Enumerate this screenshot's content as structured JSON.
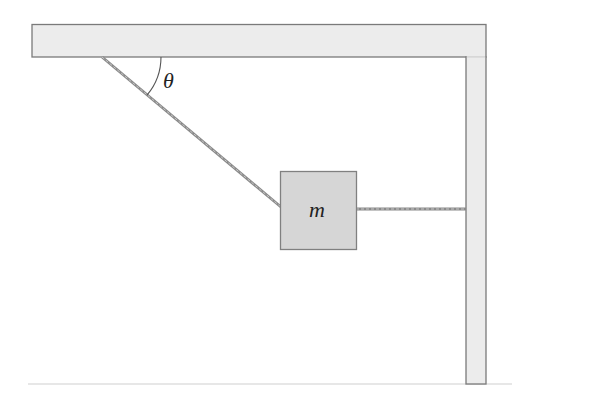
{
  "diagram": {
    "title": "",
    "labels": {
      "angle": "θ",
      "mass": "m"
    },
    "elements": [
      {
        "id": "ceiling",
        "type": "fixed-support",
        "orientation": "horizontal"
      },
      {
        "id": "wall",
        "type": "fixed-support",
        "orientation": "vertical"
      },
      {
        "id": "floor",
        "type": "ground-line"
      },
      {
        "id": "rope-angled",
        "from": "ceiling",
        "to": "mass"
      },
      {
        "id": "rope-horizontal",
        "from": "mass",
        "to": "wall"
      },
      {
        "id": "mass",
        "type": "block",
        "label": "m"
      },
      {
        "id": "angle-arc",
        "between": [
          "ceiling",
          "rope-angled"
        ],
        "label": "θ"
      }
    ],
    "colors": {
      "support_fill": "#ececec",
      "support_stroke": "#7a7a7a",
      "block_fill": "#d6d6d6",
      "block_stroke": "#808080",
      "rope": "#8a8a8a",
      "floor": "#c8c8c8"
    }
  }
}
